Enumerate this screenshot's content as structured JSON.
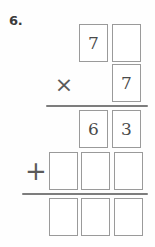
{
  "worksheet": {
    "problem_number": "6.",
    "operation_type": "long-multiplication",
    "operators": {
      "multiply": "×",
      "add": "+"
    },
    "rows": [
      {
        "name": "multiplicand",
        "cells": [
          {
            "value": "7",
            "filled": true
          },
          {
            "value": "",
            "filled": false
          }
        ]
      },
      {
        "name": "multiplier",
        "cells": [
          {
            "value": "7",
            "filled": true
          }
        ]
      },
      {
        "name": "partial-product-1",
        "cells": [
          {
            "value": "6",
            "filled": true
          },
          {
            "value": "3",
            "filled": true
          }
        ]
      },
      {
        "name": "partial-product-2",
        "cells": [
          {
            "value": "",
            "filled": false
          },
          {
            "value": "",
            "filled": false
          },
          {
            "value": "",
            "filled": false
          }
        ]
      },
      {
        "name": "final-sum",
        "cells": [
          {
            "value": "",
            "filled": false
          },
          {
            "value": "",
            "filled": false
          },
          {
            "value": "",
            "filled": false
          }
        ]
      }
    ],
    "colors": {
      "box_border": "#9a9a9a",
      "digit": "#4a4a4a",
      "rule": "#7d7d7d",
      "label": "#3b3b3b",
      "background": "#fefefe"
    }
  }
}
